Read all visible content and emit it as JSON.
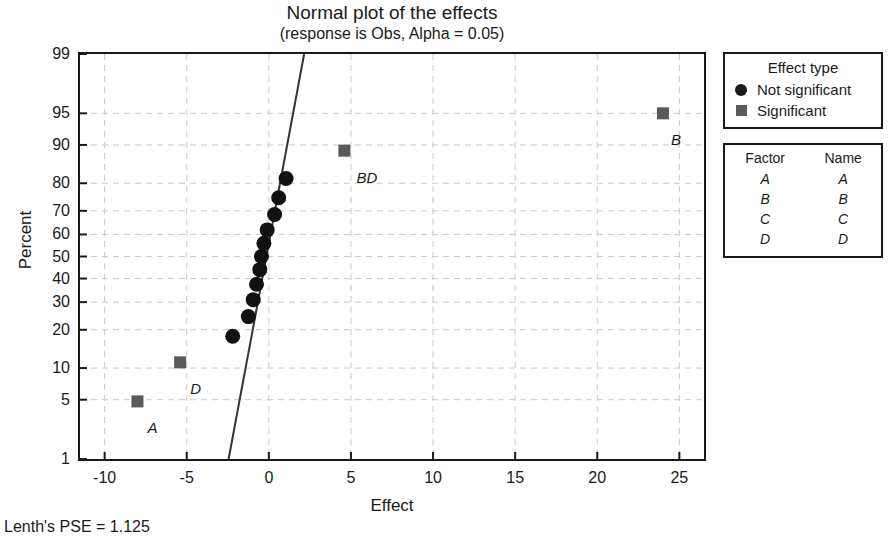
{
  "chart_data": {
    "type": "scatter",
    "title": "Normal plot of the effects",
    "subtitle": "(response is Obs, Alpha = 0.05)",
    "xlabel": "Effect",
    "ylabel": "Percent",
    "xlim": [
      -11.5,
      26.5
    ],
    "ylim": [
      1,
      99
    ],
    "yscale": "normal-probability",
    "grid": true,
    "xticks": [
      -10,
      -5,
      0,
      5,
      10,
      15,
      20,
      25
    ],
    "yticks": [
      1,
      5,
      10,
      20,
      30,
      40,
      50,
      60,
      70,
      80,
      90,
      95,
      99
    ],
    "fit_line": {
      "x_at_y1": -2.45,
      "x_at_y99": 2.15
    },
    "points": [
      {
        "effect": -8.0,
        "percent": 4.8,
        "type": "Significant",
        "label": "A",
        "label_dx": 10,
        "label_dy": 18
      },
      {
        "effect": -5.4,
        "percent": 11.2,
        "type": "Significant",
        "label": "D",
        "label_dx": 10,
        "label_dy": 18
      },
      {
        "effect": -2.2,
        "percent": 18.0,
        "type": "Not significant",
        "label": "",
        "label_dx": 0,
        "label_dy": 0
      },
      {
        "effect": -1.25,
        "percent": 24.5,
        "type": "Not significant",
        "label": "",
        "label_dx": 0,
        "label_dy": 0
      },
      {
        "effect": -0.95,
        "percent": 31.0,
        "type": "Not significant",
        "label": "",
        "label_dx": 0,
        "label_dy": 0
      },
      {
        "effect": -0.75,
        "percent": 37.5,
        "type": "Not significant",
        "label": "",
        "label_dx": 0,
        "label_dy": 0
      },
      {
        "effect": -0.55,
        "percent": 44.0,
        "type": "Not significant",
        "label": "",
        "label_dx": 0,
        "label_dy": 0
      },
      {
        "effect": -0.45,
        "percent": 50.0,
        "type": "Not significant",
        "label": "",
        "label_dx": 0,
        "label_dy": 0
      },
      {
        "effect": -0.3,
        "percent": 56.0,
        "type": "Not significant",
        "label": "",
        "label_dx": 0,
        "label_dy": 0
      },
      {
        "effect": -0.1,
        "percent": 62.0,
        "type": "Not significant",
        "label": "",
        "label_dx": 0,
        "label_dy": 0
      },
      {
        "effect": 0.35,
        "percent": 68.5,
        "type": "Not significant",
        "label": "",
        "label_dx": 0,
        "label_dy": 0
      },
      {
        "effect": 0.6,
        "percent": 75.0,
        "type": "Not significant",
        "label": "",
        "label_dx": 0,
        "label_dy": 0
      },
      {
        "effect": 1.05,
        "percent": 81.5,
        "type": "Not significant",
        "label": "",
        "label_dx": 0,
        "label_dy": 0
      },
      {
        "effect": 4.6,
        "percent": 88.8,
        "type": "Significant",
        "label": "BD",
        "label_dx": 12,
        "label_dy": 18
      },
      {
        "effect": 24.0,
        "percent": 95.0,
        "type": "Significant",
        "label": "B",
        "label_dx": 8,
        "label_dy": 18
      }
    ]
  },
  "legend_effect_type": {
    "title": "Effect type",
    "items": [
      {
        "marker": "circle",
        "label": "Not significant"
      },
      {
        "marker": "square",
        "label": "Significant"
      }
    ]
  },
  "legend_factors": {
    "headers": [
      "Factor",
      "Name"
    ],
    "rows": [
      {
        "factor": "A",
        "name": "A"
      },
      {
        "factor": "B",
        "name": "B"
      },
      {
        "factor": "C",
        "name": "C"
      },
      {
        "factor": "D",
        "name": "D"
      }
    ]
  },
  "footer": {
    "note": "Lenth's PSE = 1.125"
  },
  "colors": {
    "axis": "#1a1a1a",
    "grid": "#c9c9c9",
    "not_significant_marker": "#111111",
    "significant_marker": "#5a5a5a",
    "fit_line": "#333333"
  }
}
